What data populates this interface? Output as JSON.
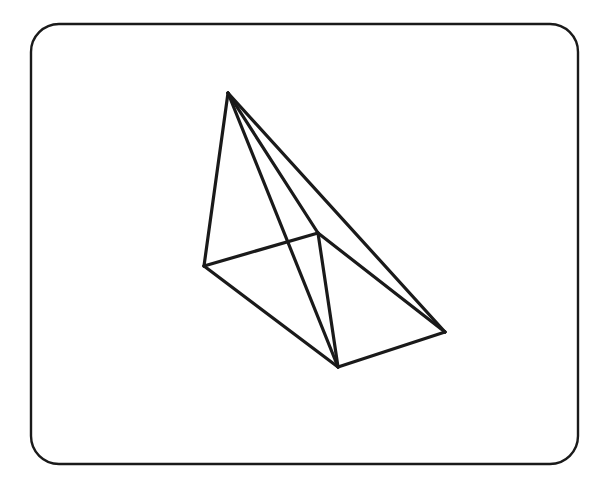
{
  "page": {
    "width": 614,
    "height": 489,
    "background_color": "#ffffff",
    "ink_color": "#1a1a1a"
  },
  "frame": {
    "name": "rounded-rectangle-border",
    "x": 31,
    "y": 24,
    "width": 547,
    "height": 440,
    "corner_radius": 28,
    "stroke_color": "#1a1a1a",
    "stroke_width": 2.4,
    "fill": "none"
  },
  "figure": {
    "name": "wireframe-polyhedron",
    "shape_type": "triangular-wedge",
    "stroke_color": "#1a1a1a",
    "stroke_width": 3.2,
    "vertices": [
      {
        "id": "A",
        "label": "apex-top",
        "x": 228,
        "y": 93
      },
      {
        "id": "B",
        "label": "left",
        "x": 204,
        "y": 266
      },
      {
        "id": "C",
        "label": "mid-right",
        "x": 318,
        "y": 233
      },
      {
        "id": "D",
        "label": "bottom",
        "x": 338,
        "y": 367
      },
      {
        "id": "E",
        "label": "far-right",
        "x": 445,
        "y": 332
      }
    ],
    "edges": [
      {
        "id": "AB",
        "from": "A",
        "to": "B",
        "x1": 228,
        "y1": 93,
        "x2": 204,
        "y2": 266
      },
      {
        "id": "AC",
        "from": "A",
        "to": "C",
        "x1": 228,
        "y1": 93,
        "x2": 318,
        "y2": 233
      },
      {
        "id": "AD",
        "from": "A",
        "to": "D",
        "x1": 228,
        "y1": 93,
        "x2": 338,
        "y2": 367
      },
      {
        "id": "AE",
        "from": "A",
        "to": "E",
        "x1": 228,
        "y1": 93,
        "x2": 445,
        "y2": 332
      },
      {
        "id": "BC",
        "from": "B",
        "to": "C",
        "x1": 204,
        "y1": 266,
        "x2": 318,
        "y2": 233
      },
      {
        "id": "BD",
        "from": "B",
        "to": "D",
        "x1": 204,
        "y1": 266,
        "x2": 338,
        "y2": 367
      },
      {
        "id": "CD",
        "from": "C",
        "to": "D",
        "x1": 318,
        "y1": 233,
        "x2": 338,
        "y2": 367
      },
      {
        "id": "CE",
        "from": "C",
        "to": "E",
        "x1": 318,
        "y1": 233,
        "x2": 445,
        "y2": 332
      },
      {
        "id": "DE",
        "from": "D",
        "to": "E",
        "x1": 338,
        "y1": 367,
        "x2": 445,
        "y2": 332
      }
    ]
  }
}
